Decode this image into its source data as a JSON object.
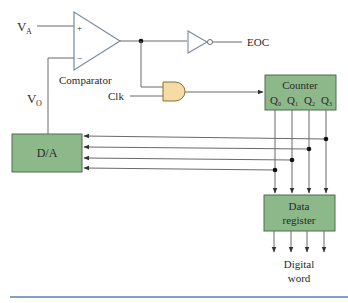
{
  "diagram": {
    "labels": {
      "va": "V",
      "va_sub": "A",
      "vo": "V",
      "vo_sub": "O",
      "plus": "+",
      "minus": "−",
      "comparator": "Comparator",
      "clk": "Clk",
      "eoc": "EOC",
      "digital_word_line1": "Digital",
      "digital_word_line2": "word"
    },
    "blocks": {
      "counter": {
        "title": "Counter",
        "outputs": [
          "Q",
          "Q",
          "Q",
          "Q"
        ],
        "output_subs": [
          "0",
          "1",
          "2",
          "3"
        ]
      },
      "dac": {
        "title": "D/A"
      },
      "data_register": {
        "line1": "Data",
        "line2": "register"
      }
    },
    "colors": {
      "block_fill": "#8db88a",
      "block_stroke": "#4e6e4a",
      "and_gate_fill": "#f6dca4",
      "and_gate_stroke": "#8a6a3a",
      "wire": "#6a6a6a",
      "gate_stroke": "#7a8a9a",
      "rule": "#5a7fb0"
    }
  }
}
